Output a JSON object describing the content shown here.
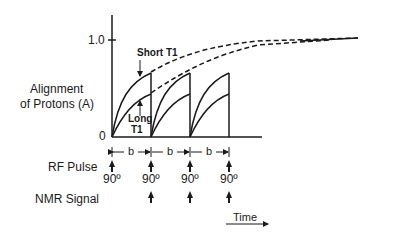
{
  "diagram": {
    "y_axis_label_line1": "Alignment",
    "y_axis_label_line2": "of Protons (A)",
    "y_tick_top": "1.0",
    "y_tick_zero": "0",
    "curve_labels": {
      "short_t1": "Short T1",
      "long_t1_line1": "Long",
      "long_t1_line2": "T1"
    },
    "interval_label": "b",
    "rf_pulse_label": "RF Pulse",
    "nmr_signal_label": "NMR Signal",
    "pulse_angle": "90º",
    "pulses": [
      "90º",
      "90º",
      "90º",
      "90º"
    ],
    "time_label": "Time",
    "colors": {
      "ink": "#1a1a1a",
      "background": "#ffffff"
    }
  }
}
